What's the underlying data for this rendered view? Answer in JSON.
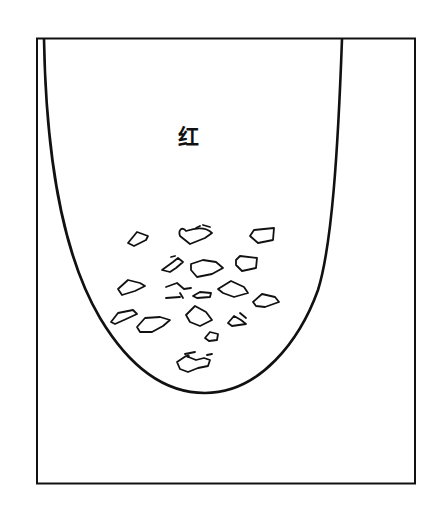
{
  "diagram": {
    "type": "test-tube-illustration",
    "frame": {
      "x": 37,
      "y": 38,
      "width": 378,
      "height": 445
    },
    "tube_label": "红",
    "stroke_color": "#111111",
    "background_color": "#ffffff",
    "precipitate": {
      "description": "irregular solid particles settled at bottom of tube",
      "count": 19
    }
  }
}
